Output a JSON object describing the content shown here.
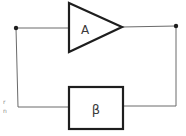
{
  "diagram": {
    "type": "feedback-loop",
    "amplifier": {
      "label": "A",
      "shape": "triangle"
    },
    "feedback": {
      "label": "β",
      "shape": "rectangle"
    },
    "nodes": [
      {
        "name": "input-node"
      },
      {
        "name": "output-node"
      }
    ],
    "margin_marks": [
      "r",
      "n"
    ]
  },
  "colors": {
    "line": "#1e1e1e",
    "thin_line": "#6a6a6a",
    "text": "#3a3a3a",
    "background": "#ffffff"
  }
}
